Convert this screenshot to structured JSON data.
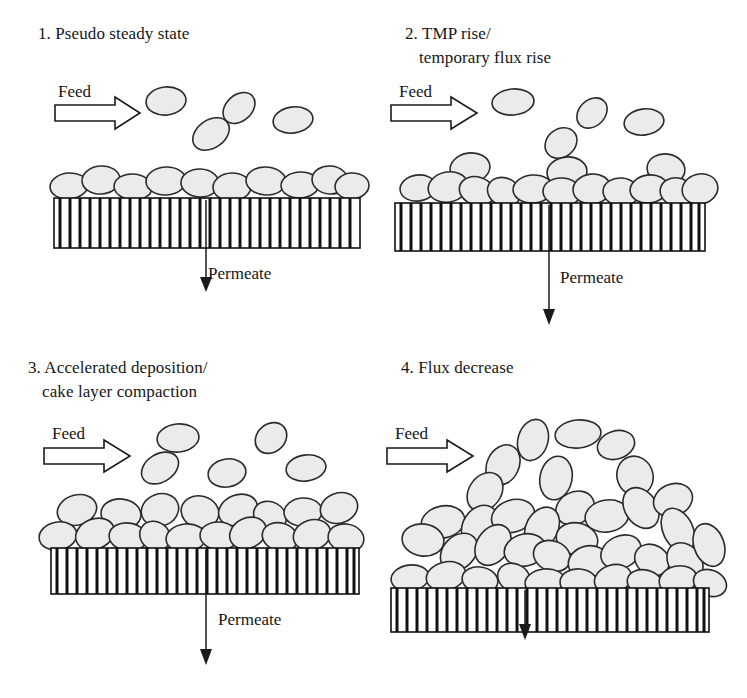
{
  "figure": {
    "kind": "schematic-diagram",
    "width": 747,
    "height": 698,
    "background_color": "#ffffff",
    "line_color": "#1a1a1a",
    "particle_fill_color": "#ebebeb",
    "particle_stroke_color": "#2b2b2b",
    "membrane_fill_color": "#ffffff",
    "membrane_stroke_color": "#111111"
  },
  "panels": [
    {
      "index": "1",
      "number_label": "1.",
      "title_line1": "1. Pseudo steady state",
      "title_line2": "",
      "feed_label": "Feed",
      "permeate_label": "Permeate",
      "free_particle_count": 4,
      "cake_particle_count": 11,
      "cake_layers": 1,
      "permeate_arrow_length": "short",
      "description": "Single monolayer of particles on the membrane; a few particles suspended in the feed stream."
    },
    {
      "index": "2",
      "number_label": "2.",
      "title_line1": "2. TMP rise/",
      "title_line2": "temporary flux rise",
      "feed_label": "Feed",
      "permeate_label": "Permeate",
      "free_particle_count": 5,
      "cake_particle_count": 18,
      "cake_layers": 2,
      "permeate_arrow_length": "long",
      "description": "Cake layer thickens unevenly with partial second layer; transmembrane pressure rises."
    },
    {
      "index": "3",
      "number_label": "3.",
      "title_line1": "3. Accelerated deposition/",
      "title_line2": "cake layer compaction",
      "feed_label": "Feed",
      "permeate_label": "Permeate",
      "free_particle_count": 5,
      "cake_particle_count": 26,
      "cake_layers": 2,
      "permeate_arrow_length": "medium",
      "description": "Two full layers of compacted particles across the whole membrane surface."
    },
    {
      "index": "4",
      "number_label": "4.",
      "title_line1": "4. Flux decrease",
      "title_line2": "",
      "feed_label": "Feed",
      "permeate_label": "Permeate",
      "free_particle_count": 4,
      "cake_particle_count": 44,
      "cake_layers": 4,
      "permeate_arrow_length": "short",
      "description": "Thick, dense, randomly oriented multilayer cake causing permeate flux decline."
    }
  ],
  "legend_semantics": {
    "feed_arrow": "hollow block arrow indicating feed flow direction, left to right",
    "permeate_arrow": "thin solid arrow pointing down through the membrane",
    "membrane": "vertically striped horizontal bar representing the porous membrane",
    "particle": "grey stippled ellipse representing a foulant particle"
  }
}
